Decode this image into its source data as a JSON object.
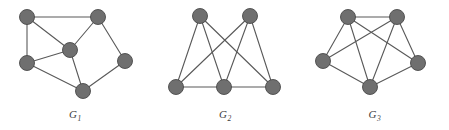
{
  "figure": {
    "width": 449,
    "height": 130,
    "background": "#ffffff",
    "node_fill": "#6f6f6f",
    "node_stroke": "#4a4a4a",
    "edge_color": "#595959",
    "label_color": "#3c3c3c",
    "node_radius": 7.5,
    "edge_width": 1.1
  },
  "graphs": [
    {
      "id": "G1",
      "label_text": "G",
      "label_sub": "1",
      "label_full": "G1",
      "panel": {
        "left": 0,
        "width": 150
      },
      "node_count": 6,
      "edge_count": 8,
      "nodes": [
        {
          "id": "n1",
          "name": "top-left",
          "x": 27,
          "y": 17
        },
        {
          "id": "n2",
          "name": "top-right",
          "x": 98,
          "y": 17
        },
        {
          "id": "n3",
          "name": "center",
          "x": 70,
          "y": 50
        },
        {
          "id": "n4",
          "name": "mid-left",
          "x": 27,
          "y": 63
        },
        {
          "id": "n5",
          "name": "right",
          "x": 125,
          "y": 61
        },
        {
          "id": "n6",
          "name": "bottom",
          "x": 83,
          "y": 91
        }
      ],
      "edges": [
        [
          "n1",
          "n2"
        ],
        [
          "n1",
          "n4"
        ],
        [
          "n1",
          "n3"
        ],
        [
          "n2",
          "n3"
        ],
        [
          "n2",
          "n5"
        ],
        [
          "n3",
          "n4"
        ],
        [
          "n3",
          "n6"
        ],
        [
          "n4",
          "n6"
        ],
        [
          "n5",
          "n6"
        ]
      ]
    },
    {
      "id": "G2",
      "label_text": "G",
      "label_sub": "2",
      "label_full": "G2",
      "panel": {
        "left": 150,
        "width": 150
      },
      "node_count": 5,
      "edge_count": 8,
      "nodes": [
        {
          "id": "m1",
          "name": "top-left",
          "x": 50,
          "y": 16
        },
        {
          "id": "m2",
          "name": "top-right",
          "x": 100,
          "y": 16
        },
        {
          "id": "m3",
          "name": "bottom-left",
          "x": 26,
          "y": 87
        },
        {
          "id": "m4",
          "name": "bottom-mid",
          "x": 74,
          "y": 87
        },
        {
          "id": "m5",
          "name": "bottom-right",
          "x": 123,
          "y": 87
        }
      ],
      "edges": [
        [
          "m1",
          "m3"
        ],
        [
          "m1",
          "m4"
        ],
        [
          "m1",
          "m5"
        ],
        [
          "m2",
          "m3"
        ],
        [
          "m2",
          "m4"
        ],
        [
          "m2",
          "m5"
        ],
        [
          "m3",
          "m4"
        ],
        [
          "m4",
          "m5"
        ]
      ]
    },
    {
      "id": "G3",
      "label_text": "G",
      "label_sub": "3",
      "label_full": "G3",
      "panel": {
        "left": 300,
        "width": 149
      },
      "node_count": 5,
      "edge_count": 8,
      "nodes": [
        {
          "id": "k1",
          "name": "top-left",
          "x": 48,
          "y": 17
        },
        {
          "id": "k2",
          "name": "top-right",
          "x": 97,
          "y": 17
        },
        {
          "id": "k3",
          "name": "mid-left",
          "x": 23,
          "y": 61
        },
        {
          "id": "k4",
          "name": "mid-right",
          "x": 118,
          "y": 63
        },
        {
          "id": "k5",
          "name": "bottom",
          "x": 70,
          "y": 87
        }
      ],
      "edges": [
        [
          "k1",
          "k2"
        ],
        [
          "k1",
          "k3"
        ],
        [
          "k1",
          "k4"
        ],
        [
          "k1",
          "k5"
        ],
        [
          "k2",
          "k3"
        ],
        [
          "k2",
          "k4"
        ],
        [
          "k2",
          "k5"
        ],
        [
          "k3",
          "k5"
        ],
        [
          "k4",
          "k5"
        ]
      ]
    }
  ]
}
